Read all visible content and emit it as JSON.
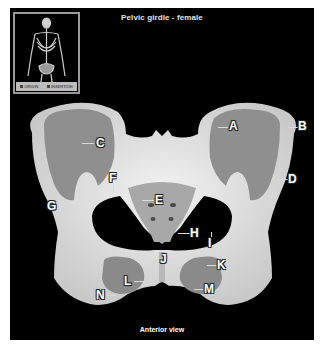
{
  "title": "Pelvic girdle - female",
  "caption": "Anterior view",
  "thumbnail": {
    "icon": "skeleton-icon",
    "legend": [
      {
        "label": "ORIGIN",
        "color": "#444444"
      },
      {
        "label": "INSERTION",
        "color": "#444444"
      }
    ]
  },
  "labels": {
    "A": "A",
    "B": "B",
    "C": "C",
    "D": "D",
    "E": "E",
    "F": "F",
    "G": "G",
    "H": "H",
    "I": "I",
    "J": "J",
    "K": "K",
    "L": "L",
    "M": "M",
    "N": "N"
  },
  "colors": {
    "background": "#000000",
    "bone": "#d9d9d9",
    "iliac_fossa": "#8f8f8f",
    "label_text": "#ffffff"
  }
}
